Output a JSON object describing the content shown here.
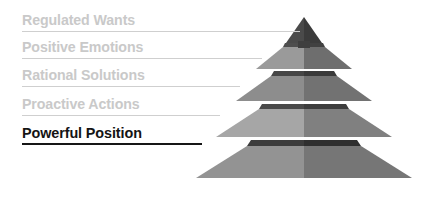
{
  "diagram": {
    "type": "pyramid",
    "title": "",
    "orientation": "labels-left-pyramid-right",
    "tier_count": 5,
    "levels": [
      {
        "rank": 1,
        "position": "top",
        "label": "Regulated Wants",
        "emphasis": false,
        "text_color": "#c9c9c9",
        "leader_color": "#cfcfcf",
        "tier_fill_left": "#4a4a4a",
        "tier_fill_right": "#3b3b3b"
      },
      {
        "rank": 2,
        "position": "upper-middle",
        "label": "Positive Emotions",
        "emphasis": false,
        "text_color": "#c9c9c9",
        "leader_color": "#cfcfcf",
        "tier_fill_left": "#9a9a9a",
        "tier_fill_right": "#6e6e6e"
      },
      {
        "rank": 3,
        "position": "middle",
        "label": "Rational Solutions",
        "emphasis": false,
        "text_color": "#c9c9c9",
        "leader_color": "#cfcfcf",
        "tier_fill_left": "#8d8d8d",
        "tier_fill_right": "#727272"
      },
      {
        "rank": 4,
        "position": "lower-middle",
        "label": "Proactive Actions",
        "emphasis": false,
        "text_color": "#c9c9c9",
        "leader_color": "#cfcfcf",
        "tier_fill_left": "#a6a6a6",
        "tier_fill_right": "#808080"
      },
      {
        "rank": 5,
        "position": "base",
        "label": "Powerful Position",
        "emphasis": true,
        "text_color": "#141414",
        "leader_color": "#161616",
        "tier_fill_left": "#939393",
        "tier_fill_right": "#767676"
      }
    ],
    "colors": {
      "background": "#ffffff",
      "apex_dark": "#4a4a4a",
      "shadow_gap": "#3a3a3a",
      "muted_text": "#c9c9c9",
      "emphasis_text": "#141414"
    }
  }
}
